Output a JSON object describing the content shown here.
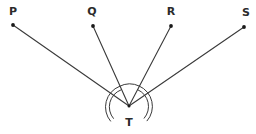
{
  "figure": {
    "type": "geometry-diagram",
    "canvas": {
      "width": 256,
      "height": 134,
      "background": "#ffffff"
    },
    "stroke_color": "#3a3a3a",
    "point_color": "#1a1a1a",
    "label_color": "#2b2b2b",
    "vertex": {
      "id": "T",
      "label": "T",
      "x": 129,
      "y": 106,
      "label_x": 129,
      "label_y": 122
    },
    "points": [
      {
        "id": "P",
        "label": "P",
        "x": 13,
        "y": 25,
        "label_x": 13,
        "label_y": 11
      },
      {
        "id": "Q",
        "label": "Q",
        "x": 93,
        "y": 26,
        "label_x": 92,
        "label_y": 11
      },
      {
        "id": "R",
        "label": "R",
        "x": 171,
        "y": 26,
        "label_x": 171,
        "label_y": 11
      },
      {
        "id": "S",
        "label": "S",
        "x": 244,
        "y": 27,
        "label_x": 246,
        "label_y": 12
      }
    ],
    "rays": [
      {
        "id": "ray-TP",
        "from": "T",
        "to": "P"
      },
      {
        "id": "ray-TQ",
        "from": "T",
        "to": "Q"
      },
      {
        "id": "ray-TR",
        "from": "T",
        "to": "R"
      },
      {
        "id": "ray-TS",
        "from": "T",
        "to": "S"
      }
    ],
    "angle_marks": [
      {
        "id": "angle-PTQ",
        "between": "P-T-Q",
        "ticks": 2,
        "radius_outer": 22,
        "radius_inner": 18
      },
      {
        "id": "angle-QTR",
        "between": "Q-T-R",
        "ticks": 1,
        "radius_outer": 22
      },
      {
        "id": "angle-RTS",
        "between": "R-T-S",
        "ticks": 2,
        "radius_outer": 22,
        "radius_inner": 18
      }
    ]
  }
}
